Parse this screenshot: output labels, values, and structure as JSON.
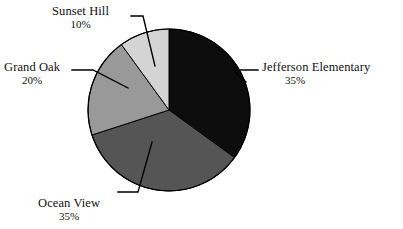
{
  "chart_data": {
    "type": "pie",
    "title": "",
    "subtitle": "",
    "xlabel": "",
    "ylabel": "",
    "legend_position": "none",
    "labels_position": "outside-with-leader-lines",
    "grid": false,
    "total_percent": 100,
    "categories": [
      "Jefferson Elementary",
      "Ocean View",
      "Grand Oak",
      "Sunset Hill"
    ],
    "values": [
      35,
      35,
      20,
      10
    ],
    "value_labels": [
      "35%",
      "35%",
      "20%",
      "10%"
    ],
    "colors": [
      "#0d0d0d",
      "#555555",
      "#999999",
      "#d4d4d4"
    ],
    "start_angle_deg": 0,
    "direction": "clockwise",
    "slices": [
      {
        "name": "Jefferson Elementary",
        "value": 35,
        "value_label": "35%",
        "color": "#0d0d0d",
        "start_deg": 0,
        "end_deg": 126
      },
      {
        "name": "Ocean View",
        "value": 35,
        "value_label": "35%",
        "color": "#555555",
        "start_deg": 126,
        "end_deg": 252
      },
      {
        "name": "Grand Oak",
        "value": 20,
        "value_label": "20%",
        "color": "#999999",
        "start_deg": 252,
        "end_deg": 324
      },
      {
        "name": "Sunset Hill",
        "value": 10,
        "value_label": "10%",
        "color": "#d4d4d4",
        "start_deg": 324,
        "end_deg": 360
      }
    ]
  },
  "figure": {
    "background": "#ffffff",
    "outline_color": "#000000",
    "leader_line_color": "#000000"
  },
  "labels": {
    "jefferson": {
      "name": "Jefferson Elementary",
      "percent": "35%"
    },
    "ocean": {
      "name": "Ocean View",
      "percent": "35%"
    },
    "grandoak": {
      "name": "Grand Oak",
      "percent": "20%"
    },
    "sunset": {
      "name": "Sunset Hill",
      "percent": "10%"
    }
  }
}
